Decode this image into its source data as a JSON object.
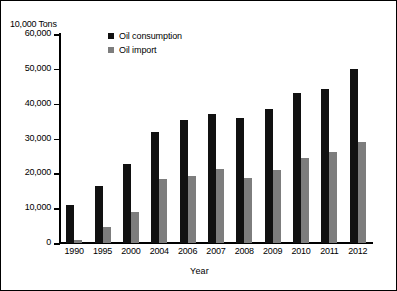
{
  "chart_data": {
    "type": "bar",
    "title": "",
    "ylabel": "10,000 Tons",
    "xlabel": "Year",
    "ylim": [
      0,
      60000
    ],
    "ytick_step": 10000,
    "grid": false,
    "legend_position": "inside-top-left",
    "categories": [
      "1990",
      "1995",
      "2000",
      "2004",
      "2006",
      "2007",
      "2008",
      "2009",
      "2010",
      "2011",
      "2012"
    ],
    "ytick_labels": [
      "60,000",
      "50,000",
      "40,000",
      "30,000",
      "20,000",
      "10,000",
      "0"
    ],
    "ytick_values": [
      60000,
      50000,
      40000,
      30000,
      20000,
      10000,
      0
    ],
    "series": [
      {
        "name": "Oil consumption",
        "color": "#111111",
        "values": [
          10800,
          16500,
          22800,
          32000,
          35400,
          37000,
          36000,
          38400,
          43100,
          44300,
          50000
        ]
      },
      {
        "name": "Oil import",
        "color": "#7d7d7d",
        "values": [
          1000,
          4700,
          9000,
          18400,
          19200,
          21200,
          18700,
          20900,
          24300,
          26000,
          29000
        ]
      }
    ]
  }
}
